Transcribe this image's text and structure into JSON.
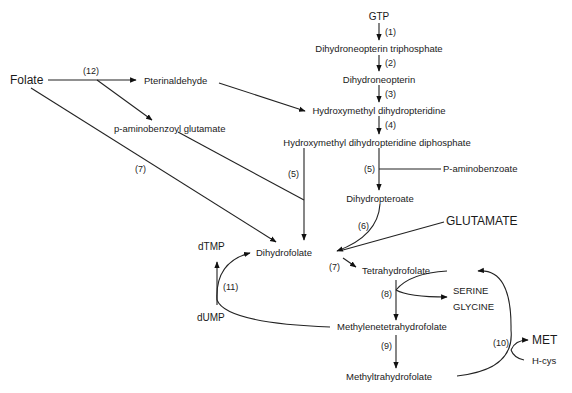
{
  "diagram": {
    "type": "metabolic-pathway",
    "nodes": {
      "gtp": "GTP",
      "dhntp": "Dihydroneopterin triphosphate",
      "dhn": "Dihydroneopterin",
      "hmdhp": "Hydroxymethyl dihydropteridine",
      "hmdhpp": "Hydroxymethyl dihydropteridine diphosphate",
      "paba": "P-aminobenzoate",
      "dhpteroate": "Dihydropteroate",
      "glutamate": "GLUTAMATE",
      "folate": "Folate",
      "pterinaldehyde": "Pterinaldehyde",
      "pabg": "p-aminobenzoyl glutamate",
      "dhf": "Dihydrofolate",
      "dtmp": "dTMP",
      "dump": "dUMP",
      "thf": "Tetrahydrofolate",
      "serine": "SERINE",
      "glycine": "GLYCINE",
      "methylene_thf": "Methylenetetrahydrofolate",
      "methyl_thf": "Methyltrahydrofolate",
      "met": "MET",
      "hcys": "H-cys"
    },
    "enzyme_labels": {
      "e1": "(1)",
      "e2": "(2)",
      "e3": "(3)",
      "e4": "(4)",
      "e5a": "(5)",
      "e5b": "(5)",
      "e6": "(6)",
      "e7a": "(7)",
      "e7b": "(7)",
      "e8": "(8)",
      "e9": "(9)",
      "e10": "(10)",
      "e11": "(11)",
      "e12": "(12)"
    },
    "edges": [
      {
        "from": "GTP",
        "to": "Dihydroneopterin triphosphate",
        "enzyme": "(1)"
      },
      {
        "from": "Dihydroneopterin triphosphate",
        "to": "Dihydroneopterin",
        "enzyme": "(2)"
      },
      {
        "from": "Dihydroneopterin",
        "to": "Hydroxymethyl dihydropteridine",
        "enzyme": "(3)"
      },
      {
        "from": "Hydroxymethyl dihydropteridine",
        "to": "Hydroxymethyl dihydropteridine diphosphate",
        "enzyme": "(4)"
      },
      {
        "from": "Hydroxymethyl dihydropteridine diphosphate + P-aminobenzoate",
        "to": "Dihydropteroate",
        "enzyme": "(5)"
      },
      {
        "from": "Dihydropteroate + GLUTAMATE",
        "to": "Dihydrofolate",
        "enzyme": "(6)"
      },
      {
        "from": "Folate",
        "to": "Pterinaldehyde + p-aminobenzoyl glutamate",
        "enzyme": "(12)"
      },
      {
        "from": "Pterinaldehyde",
        "to": "Hydroxymethyl dihydropteridine",
        "enzyme": ""
      },
      {
        "from": "Hydroxymethyl dihydropteridine diphosphate + p-aminobenzoyl glutamate",
        "to": "Dihydrofolate",
        "enzyme": "(5)"
      },
      {
        "from": "Folate",
        "to": "Dihydrofolate",
        "enzyme": "(7)"
      },
      {
        "from": "Dihydrofolate",
        "to": "Tetrahydrofolate",
        "enzyme": "(7)"
      },
      {
        "from": "Tetrahydrofolate + SERINE",
        "to": "Methylenetetrahydrofolate + GLYCINE",
        "enzyme": "(8)"
      },
      {
        "from": "Methylenetetrahydrofolate",
        "to": "Methyltrahydrofolate",
        "enzyme": "(9)"
      },
      {
        "from": "Methyltrahydrofolate + H-cys",
        "to": "Tetrahydrofolate + MET",
        "enzyme": "(10)"
      },
      {
        "from": "Methylenetetrahydrofolate + dUMP",
        "to": "Dihydrofolate + dTMP",
        "enzyme": "(11)"
      }
    ]
  }
}
